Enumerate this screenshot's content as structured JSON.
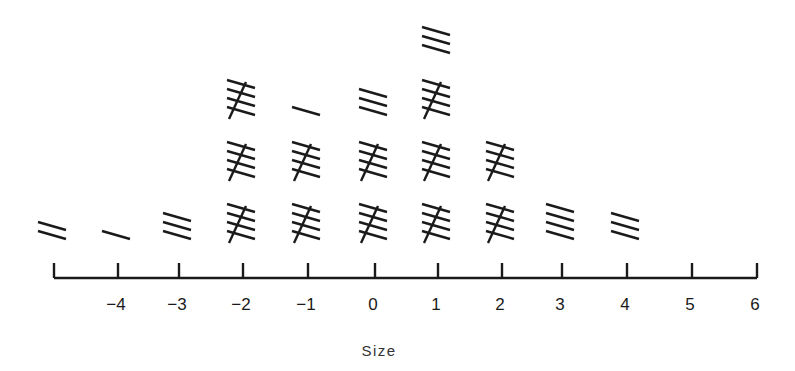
{
  "chart_data": {
    "type": "tally",
    "title": "",
    "xlabel": "Size",
    "ylabel": "",
    "categories": [
      -5,
      -4,
      -3,
      -2,
      -1,
      0,
      1,
      2,
      3,
      4,
      5,
      6
    ],
    "tick_labels": [
      "",
      "−4",
      "−3",
      "−2",
      "−1",
      "0",
      "1",
      "2",
      "3",
      "4",
      "5",
      "6"
    ],
    "values": [
      2,
      1,
      3,
      15,
      11,
      13,
      18,
      10,
      4,
      3,
      0,
      0
    ],
    "grouping": "tally marks in groups of five (four parallel strokes with a diagonal cross-stroke)",
    "xlim": [
      -5,
      6
    ],
    "grid": false,
    "legend": null
  },
  "colors": {
    "ink": "#1a1a1a"
  }
}
